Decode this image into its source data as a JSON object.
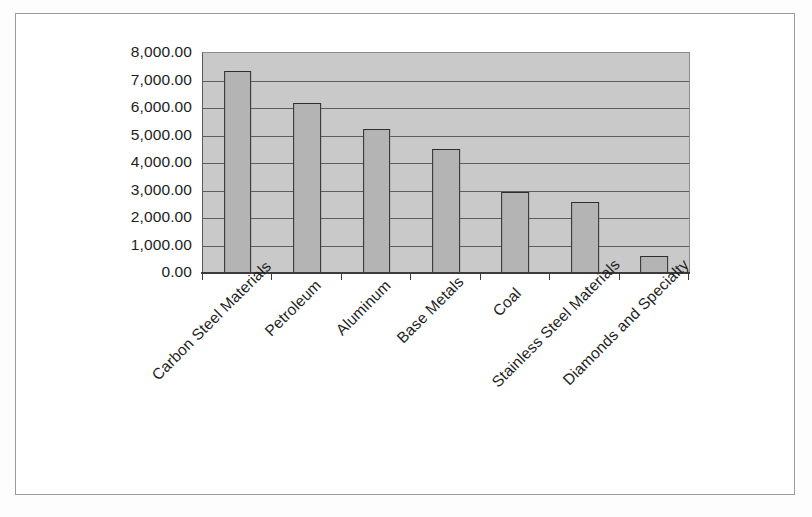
{
  "chart_data": {
    "type": "bar",
    "title": "",
    "subtitle": "",
    "xlabel": "",
    "ylabel": "",
    "categories": [
      "Carbon Steel Materials",
      "Petroleum",
      "Aluminum",
      "Base Metals",
      "Coal",
      "Stainless Steel Materials",
      "Diamonds and Specialty"
    ],
    "values": [
      7350,
      6180,
      5250,
      4500,
      2950,
      2570,
      620
    ],
    "ylim": [
      0,
      8000
    ],
    "ytick_values": [
      0,
      1000,
      2000,
      3000,
      4000,
      5000,
      6000,
      7000,
      8000
    ],
    "ytick_labels": [
      "0.00",
      "1,000.00",
      "2,000.00",
      "3,000.00",
      "4,000.00",
      "5,000.00",
      "6,000.00",
      "7,000.00",
      "8,000.00"
    ],
    "grid": true,
    "legend": false,
    "legend_position": "none",
    "bar_fill_color": "#b4b4b4",
    "bar_border_color": "#2e2e2e",
    "plot_background_color": "#c9c9c9",
    "gridline_color": "#5e5e5e",
    "page_background_color": "#ffffff",
    "label_rotation_degrees": -45
  }
}
